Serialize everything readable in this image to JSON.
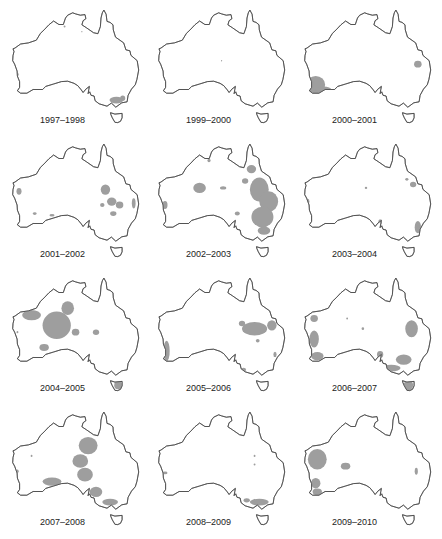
{
  "figure": {
    "type": "small-multiples-map",
    "fill_color": "#9e9e9e",
    "outline_color": "#444444",
    "panels": [
      {
        "label": "1997–1998",
        "regions": [
          {
            "lon": 146.5,
            "lat": -37.0,
            "rx": 2.2,
            "ry": 1.0
          },
          {
            "lon": 148.5,
            "lat": -36.5,
            "rx": 0.8,
            "ry": 0.8
          },
          {
            "lon": 115.0,
            "lat": -29.5,
            "rx": 0.4,
            "ry": 0.5
          },
          {
            "lon": 130.0,
            "lat": -15.5,
            "rx": 0.3,
            "ry": 0.3
          },
          {
            "lon": 135.5,
            "lat": -17.0,
            "rx": 0.2,
            "ry": 0.2
          }
        ]
      },
      {
        "label": "1999–2000",
        "regions": [
          {
            "lon": 133.5,
            "lat": -25.5,
            "rx": 0.2,
            "ry": 0.2
          },
          {
            "lon": 115.0,
            "lat": -30.5,
            "rx": 0.3,
            "ry": 0.3
          }
        ]
      },
      {
        "label": "2000–2001",
        "regions": [
          {
            "lon": 117.0,
            "lat": -32.5,
            "rx": 3.0,
            "ry": 2.5
          },
          {
            "lon": 119.5,
            "lat": -34.0,
            "rx": 2.5,
            "ry": 1.0
          },
          {
            "lon": 149.5,
            "lat": -26.5,
            "rx": 1.2,
            "ry": 1.0
          }
        ]
      },
      {
        "label": "2001–2002",
        "regions": [
          {
            "lon": 143.0,
            "lat": -24.0,
            "rx": 1.5,
            "ry": 1.5
          },
          {
            "lon": 145.0,
            "lat": -27.5,
            "rx": 1.5,
            "ry": 1.2
          },
          {
            "lon": 147.5,
            "lat": -28.5,
            "rx": 1.2,
            "ry": 1.0
          },
          {
            "lon": 142.0,
            "lat": -28.5,
            "rx": 0.7,
            "ry": 0.6
          },
          {
            "lon": 145.5,
            "lat": -31.0,
            "rx": 1.0,
            "ry": 0.7
          },
          {
            "lon": 152.0,
            "lat": -28.0,
            "rx": 0.6,
            "ry": 1.5
          },
          {
            "lon": 115.5,
            "lat": -24.5,
            "rx": 0.8,
            "ry": 1.0
          },
          {
            "lon": 120.5,
            "lat": -31.0,
            "rx": 0.6,
            "ry": 0.4
          },
          {
            "lon": 126.0,
            "lat": -31.5,
            "rx": 0.8,
            "ry": 0.4
          }
        ]
      },
      {
        "label": "2002–2003",
        "regions": [
          {
            "lon": 145.5,
            "lat": -24.0,
            "rx": 3.0,
            "ry": 3.5
          },
          {
            "lon": 148.5,
            "lat": -27.5,
            "rx": 3.0,
            "ry": 3.0
          },
          {
            "lon": 146.5,
            "lat": -32.0,
            "rx": 3.5,
            "ry": 3.0
          },
          {
            "lon": 147.0,
            "lat": -36.0,
            "rx": 2.0,
            "ry": 1.2
          },
          {
            "lon": 143.0,
            "lat": -18.0,
            "rx": 1.5,
            "ry": 1.2
          },
          {
            "lon": 141.0,
            "lat": -21.5,
            "rx": 1.0,
            "ry": 0.8
          },
          {
            "lon": 126.5,
            "lat": -23.5,
            "rx": 2.0,
            "ry": 1.5
          },
          {
            "lon": 134.0,
            "lat": -23.5,
            "rx": 1.0,
            "ry": 0.5
          },
          {
            "lon": 129.5,
            "lat": -15.5,
            "rx": 0.5,
            "ry": 0.5
          },
          {
            "lon": 115.5,
            "lat": -28.5,
            "rx": 0.8,
            "ry": 1.2
          },
          {
            "lon": 138.5,
            "lat": -31.0,
            "rx": 0.8,
            "ry": 0.6
          }
        ]
      },
      {
        "label": "2003–2004",
        "regions": [
          {
            "lon": 149.5,
            "lat": -35.0,
            "rx": 1.0,
            "ry": 1.8
          },
          {
            "lon": 148.0,
            "lat": -22.5,
            "rx": 1.0,
            "ry": 0.8
          },
          {
            "lon": 146.0,
            "lat": -21.0,
            "rx": 0.5,
            "ry": 0.4
          },
          {
            "lon": 114.5,
            "lat": -27.5,
            "rx": 0.5,
            "ry": 0.8
          },
          {
            "lon": 133.0,
            "lat": -23.5,
            "rx": 0.4,
            "ry": 0.3
          },
          {
            "lon": 137.5,
            "lat": -33.5,
            "rx": 0.6,
            "ry": 0.8
          }
        ]
      },
      {
        "label": "2004–2005",
        "regions": [
          {
            "lon": 127.5,
            "lat": -24.5,
            "rx": 4.5,
            "ry": 4.0
          },
          {
            "lon": 131.0,
            "lat": -19.5,
            "rx": 2.0,
            "ry": 2.0
          },
          {
            "lon": 119.5,
            "lat": -21.5,
            "rx": 3.0,
            "ry": 1.5
          },
          {
            "lon": 123.5,
            "lat": -31.0,
            "rx": 1.5,
            "ry": 1.0
          },
          {
            "lon": 140.0,
            "lat": -26.5,
            "rx": 1.0,
            "ry": 0.8
          },
          {
            "lon": 147.0,
            "lat": -42.0,
            "rx": 1.2,
            "ry": 1.2
          },
          {
            "lon": 115.0,
            "lat": -26.5,
            "rx": 0.3,
            "ry": 0.3
          },
          {
            "lon": 133.5,
            "lat": -26.5,
            "rx": 1.2,
            "ry": 1.0
          }
        ]
      },
      {
        "label": "2005–2006",
        "regions": [
          {
            "lon": 144.0,
            "lat": -25.5,
            "rx": 4.0,
            "ry": 2.0
          },
          {
            "lon": 149.5,
            "lat": -24.5,
            "rx": 1.5,
            "ry": 1.5
          },
          {
            "lon": 140.0,
            "lat": -24.0,
            "rx": 1.0,
            "ry": 0.8
          },
          {
            "lon": 145.0,
            "lat": -29.0,
            "rx": 0.6,
            "ry": 0.5
          },
          {
            "lon": 116.0,
            "lat": -32.0,
            "rx": 1.0,
            "ry": 3.0
          },
          {
            "lon": 150.5,
            "lat": -33.0,
            "rx": 0.5,
            "ry": 0.8
          },
          {
            "lon": 140.5,
            "lat": -37.5,
            "rx": 0.8,
            "ry": 0.6
          }
        ]
      },
      {
        "label": "2006–2007",
        "regions": [
          {
            "lon": 116.5,
            "lat": -28.5,
            "rx": 1.5,
            "ry": 2.5
          },
          {
            "lon": 117.5,
            "lat": -33.5,
            "rx": 2.0,
            "ry": 1.2
          },
          {
            "lon": 116.5,
            "lat": -22.5,
            "rx": 1.2,
            "ry": 1.0
          },
          {
            "lon": 147.5,
            "lat": -25.5,
            "rx": 2.0,
            "ry": 2.5
          },
          {
            "lon": 145.0,
            "lat": -34.5,
            "rx": 2.5,
            "ry": 1.5
          },
          {
            "lon": 141.0,
            "lat": -37.0,
            "rx": 3.0,
            "ry": 1.0
          },
          {
            "lon": 137.5,
            "lat": -33.0,
            "rx": 1.0,
            "ry": 1.0
          },
          {
            "lon": 146.5,
            "lat": -42.0,
            "rx": 1.5,
            "ry": 1.5
          },
          {
            "lon": 127.0,
            "lat": -22.5,
            "rx": 0.3,
            "ry": 0.3
          },
          {
            "lon": 132.0,
            "lat": -25.5,
            "rx": 0.4,
            "ry": 0.4
          }
        ]
      },
      {
        "label": "2007–2008",
        "regions": [
          {
            "lon": 137.5,
            "lat": -20.5,
            "rx": 3.0,
            "ry": 2.5
          },
          {
            "lon": 135.0,
            "lat": -25.0,
            "rx": 2.5,
            "ry": 2.0
          },
          {
            "lon": 136.5,
            "lat": -29.0,
            "rx": 2.5,
            "ry": 2.0
          },
          {
            "lon": 140.0,
            "lat": -34.0,
            "rx": 2.0,
            "ry": 1.5
          },
          {
            "lon": 144.5,
            "lat": -37.0,
            "rx": 2.5,
            "ry": 1.0
          },
          {
            "lon": 126.0,
            "lat": -31.0,
            "rx": 3.0,
            "ry": 1.2
          },
          {
            "lon": 115.0,
            "lat": -28.0,
            "rx": 0.4,
            "ry": 0.5
          },
          {
            "lon": 119.5,
            "lat": -23.5,
            "rx": 0.3,
            "ry": 0.3
          }
        ]
      },
      {
        "label": "2008–2009",
        "regions": [
          {
            "lon": 145.5,
            "lat": -37.0,
            "rx": 3.0,
            "ry": 1.0
          },
          {
            "lon": 141.5,
            "lat": -36.5,
            "rx": 1.0,
            "ry": 0.6
          },
          {
            "lon": 115.5,
            "lat": -28.5,
            "rx": 0.8,
            "ry": 0.4
          },
          {
            "lon": 144.0,
            "lat": -23.5,
            "rx": 0.3,
            "ry": 0.3
          },
          {
            "lon": 144.0,
            "lat": -26.0,
            "rx": 0.3,
            "ry": 0.3
          }
        ]
      },
      {
        "label": "2009–2010",
        "regions": [
          {
            "lon": 117.5,
            "lat": -24.5,
            "rx": 3.0,
            "ry": 3.0
          },
          {
            "lon": 117.0,
            "lat": -31.5,
            "rx": 1.5,
            "ry": 1.5
          },
          {
            "lon": 117.5,
            "lat": -34.0,
            "rx": 1.5,
            "ry": 1.0
          },
          {
            "lon": 126.5,
            "lat": -26.5,
            "rx": 1.5,
            "ry": 1.0
          },
          {
            "lon": 149.0,
            "lat": -28.0,
            "rx": 0.5,
            "ry": 1.0
          }
        ]
      }
    ]
  }
}
